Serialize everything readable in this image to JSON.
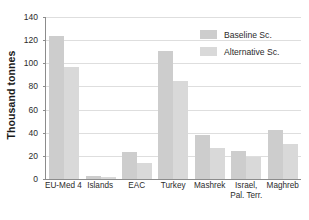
{
  "chart_data": {
    "type": "bar",
    "title": "",
    "xlabel": "",
    "ylabel": "Thousand tonnes",
    "ylim": [
      0,
      140
    ],
    "yticks": [
      0,
      20,
      40,
      60,
      80,
      100,
      120,
      140
    ],
    "grid": true,
    "legend_position": "top-right",
    "categories": [
      "EU-Med 4",
      "Islands",
      "EAC",
      "Turkey",
      "Mashrek",
      "Israel, Pal. Terr.",
      "Maghreb"
    ],
    "category_labels": [
      {
        "line1": "EU-Med 4",
        "line2": ""
      },
      {
        "line1": "Islands",
        "line2": ""
      },
      {
        "line1": "EAC",
        "line2": ""
      },
      {
        "line1": "Turkey",
        "line2": ""
      },
      {
        "line1": "Mashrek",
        "line2": ""
      },
      {
        "line1": "Israel,",
        "line2": "Pal. Terr."
      },
      {
        "line1": "Maghreb",
        "line2": ""
      }
    ],
    "series": [
      {
        "name": "Baseline Sc.",
        "color": "#cdcdcd",
        "values": [
          123,
          3,
          23,
          110,
          38,
          24,
          42
        ]
      },
      {
        "name": "Alternative Sc.",
        "color": "#d9d9d9",
        "values": [
          96,
          2,
          14,
          84,
          27,
          19,
          30
        ]
      }
    ]
  },
  "colors": {
    "baseline": "#cdcdcd",
    "alternative": "#d9d9d9",
    "axis": "#8c8c8c",
    "gridline": "#dedede",
    "text": "#2b2b2b",
    "background": "#ffffff"
  }
}
